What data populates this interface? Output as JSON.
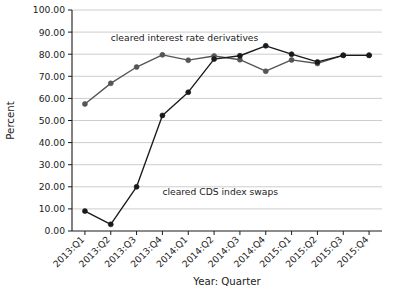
{
  "chart_data": {
    "type": "line",
    "title": "",
    "xlabel": "Year: Quarter",
    "ylabel": "Percent",
    "ylim": [
      0,
      100
    ],
    "ytick_step": 10,
    "grid": true,
    "legend_position": "inline-annotation",
    "categories": [
      "2013:Q1",
      "2013:Q2",
      "2013:Q3",
      "2013:Q4",
      "2014:Q1",
      "2014:Q2",
      "2014:Q3",
      "2014:Q4",
      "2015:Q1",
      "2015:Q2",
      "2015:Q3",
      "2015:Q4"
    ],
    "ytick_labels": [
      "0.00",
      "10.00",
      "20.00",
      "30.00",
      "40.00",
      "50.00",
      "60.00",
      "70.00",
      "80.00",
      "90.00",
      "100.00"
    ],
    "series": [
      {
        "name": "cleared interest rate derivatives",
        "color": "#555555",
        "marker": "circle",
        "annotation": "cleared interest rate derivatives",
        "values": [
          57.5,
          66.8,
          74.2,
          79.7,
          77.3,
          79.2,
          77.5,
          72.3,
          77.4,
          75.8,
          79.5,
          79.5
        ]
      },
      {
        "name": "cleared CDS index swaps",
        "color": "#1a1a1a",
        "marker": "circle",
        "annotation": "cleared CDS index swaps",
        "values": [
          9.0,
          3.0,
          20.0,
          52.3,
          62.8,
          77.8,
          79.3,
          83.8,
          80.0,
          76.5,
          79.5,
          79.5
        ]
      }
    ],
    "annotations": [
      {
        "text": "cleared interest rate derivatives",
        "x_cat": "2013:Q2",
        "y": 86.0
      },
      {
        "text": "cleared CDS index swaps",
        "x_cat": "2013:Q4",
        "y": 16.5
      }
    ]
  }
}
